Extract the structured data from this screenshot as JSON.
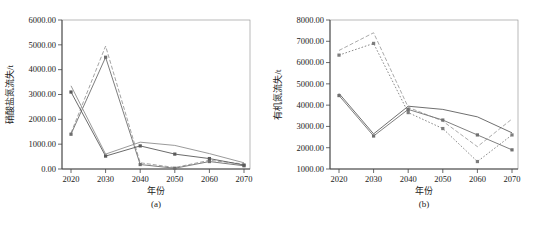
{
  "figure": {
    "background": "#ffffff",
    "axis_color": "#444444",
    "frame_color": "#8a8a8a",
    "text_color": "#222222"
  },
  "chart_data": [
    {
      "id": "a",
      "type": "line",
      "title": "",
      "sublabel": "(a)",
      "xlabel": "年份",
      "ylabel": "硝酸盐氮流失/t",
      "categories": [
        "2020",
        "2030",
        "2040",
        "2050",
        "2060",
        "2070"
      ],
      "ylim": [
        0,
        6000
      ],
      "ytick_step": 1000,
      "ytick_format": "0.00",
      "grid": false,
      "legend": "none",
      "series": [
        {
          "name": "series-1-dashed",
          "style": "dashed",
          "marker": "none",
          "color": "#9a9a9a",
          "values": [
            1450,
            4950,
            250,
            60,
            350,
            200
          ]
        },
        {
          "name": "series-2-marker",
          "style": "solid",
          "marker": "square",
          "color": "#6e6e6e",
          "values": [
            1400,
            4500,
            180,
            30,
            300,
            130
          ]
        },
        {
          "name": "series-3-plain",
          "style": "solid",
          "marker": "none",
          "color": "#8f8f8f",
          "values": [
            3350,
            600,
            1080,
            950,
            620,
            250
          ]
        },
        {
          "name": "series-4-marker",
          "style": "solid",
          "marker": "square",
          "color": "#5a5a5a",
          "values": [
            3100,
            520,
            930,
            600,
            420,
            160
          ]
        }
      ]
    },
    {
      "id": "b",
      "type": "line",
      "title": "",
      "sublabel": "(b)",
      "xlabel": "年份",
      "ylabel": "有机氮流失/t",
      "categories": [
        "2020",
        "2030",
        "2040",
        "2050",
        "2060",
        "2070"
      ],
      "ylim": [
        1000,
        8000
      ],
      "ytick_step": 1000,
      "ytick_format": "0.00",
      "grid": false,
      "legend": "none",
      "series": [
        {
          "name": "series-1-dashed",
          "style": "dashed",
          "marker": "none",
          "color": "#a0a0a0",
          "values": [
            6570,
            7400,
            3900,
            3250,
            2050,
            3350
          ]
        },
        {
          "name": "series-2-marker",
          "style": "dotted",
          "marker": "square",
          "color": "#7d7d7d",
          "values": [
            6350,
            6900,
            3650,
            2900,
            1350,
            2600
          ]
        },
        {
          "name": "series-3-plain",
          "style": "solid",
          "marker": "none",
          "color": "#5f5f5f",
          "values": [
            4550,
            2650,
            3950,
            3800,
            3450,
            2700
          ]
        },
        {
          "name": "series-4-marker",
          "style": "solid",
          "marker": "square",
          "color": "#707070",
          "values": [
            4450,
            2550,
            3800,
            3300,
            2600,
            1900
          ]
        }
      ]
    }
  ]
}
